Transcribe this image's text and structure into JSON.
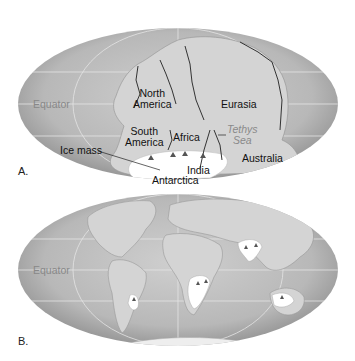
{
  "figure": {
    "panel_a": {
      "letter": "A.",
      "equator_label": "Equator",
      "continents": {
        "north_america": [
          "North",
          "America"
        ],
        "south_america": [
          "South",
          "America"
        ],
        "eurasia": "Eurasia",
        "africa": "Africa",
        "australia": "Australia",
        "india": "India",
        "antarctica": "Antarctica"
      },
      "tethys_sea": [
        "Tethys",
        "Sea"
      ],
      "ice_mass_label": "Ice mass"
    },
    "panel_b": {
      "letter": "B.",
      "equator_label": "Equator"
    },
    "colors": {
      "ocean_center": "#c4c4c4",
      "ocean_edge": "#8e8e8e",
      "land": "#d6d6d6",
      "ice": "#ffffff",
      "grid": "#e6e6e6",
      "equator_text": "#8a8a8a"
    }
  }
}
